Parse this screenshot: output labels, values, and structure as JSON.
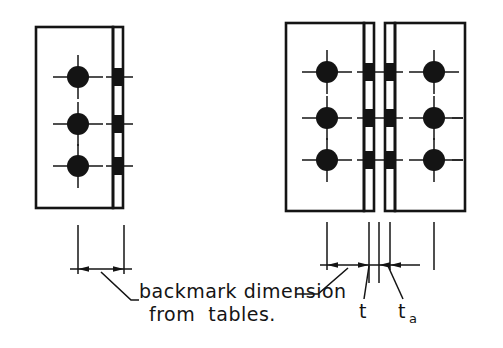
{
  "drawing": {
    "title": "Backmark dimension detail for bolted angle cleat connections",
    "type": "engineering-detail",
    "background_color": "#ffffff",
    "line_color": "#141414",
    "fill_color": "#141414"
  },
  "annotations": {
    "backmark_note_line1": "backmark dimension",
    "backmark_note_line2": "from  tables.",
    "thickness_label": "t",
    "angle_thickness_label": "t",
    "angle_thickness_subscript": "a"
  },
  "left_detail": {
    "name": "single-angle-cleat",
    "plate": {
      "x": 36,
      "y": 27,
      "width": 77,
      "height": 181
    },
    "leg": {
      "x": 113,
      "y": 27,
      "width": 10,
      "height": 181
    },
    "bolt_rows": 3,
    "bolt_centers_y": [
      77,
      124,
      166
    ],
    "bolt_center_x": 78,
    "bolt_radius": 11,
    "leg_block_height": 18
  },
  "right_detail": {
    "name": "double-angle-cleat-back-to-back",
    "left_plate": {
      "x": 286,
      "y": 23,
      "width": 78,
      "height": 188
    },
    "left_leg": {
      "x": 364,
      "y": 23,
      "width": 10,
      "height": 188
    },
    "right_leg": {
      "x": 385,
      "y": 23,
      "width": 10,
      "height": 188
    },
    "right_plate": {
      "x": 395,
      "y": 23,
      "width": 70,
      "height": 188
    },
    "gap": {
      "x": 374,
      "y": 23,
      "width": 11
    },
    "bolt_rows": 3,
    "bolt_centers_y": [
      72,
      118,
      160
    ],
    "left_bolt_center_x": 327,
    "right_bolt_center_x": 434,
    "bolt_radius": 11,
    "leg_block_height": 18
  },
  "dimensions": {
    "left": {
      "name": "backmark-dimension-left",
      "line_y": 269,
      "extension_x": [
        78,
        124
      ],
      "extension_top_y": 225
    },
    "right": {
      "name": "dimension-group-right",
      "line_y": 265,
      "extension_x": [
        327,
        369,
        379,
        390,
        434
      ],
      "extension_top_y": 222,
      "segments": [
        {
          "label": "backmark",
          "from": 327,
          "to": 369
        },
        {
          "label": "t",
          "from": 369,
          "to": 379
        },
        {
          "label": "ta",
          "from": 379,
          "to": 390
        }
      ]
    }
  },
  "leaders": {
    "left_leader": {
      "from_x": 101,
      "from_y": 272,
      "bend_x": 131,
      "bend_y": 300,
      "to_x": 137
    },
    "right_leader": {
      "from_x": 348,
      "from_y": 268,
      "bend_x": 318,
      "bend_y": 294,
      "to_x": 296
    },
    "t_leader": {
      "from_x": 369,
      "from_y": 266,
      "to_x": 364,
      "to_y": 300
    },
    "ta_leader": {
      "from_x": 390,
      "from_y": 266,
      "to_x": 404,
      "to_y": 300
    }
  },
  "side_dashes": {
    "name": "edge-dash-marks",
    "x_start": 452,
    "x_end": 463,
    "rows_y": [
      118,
      160
    ]
  }
}
